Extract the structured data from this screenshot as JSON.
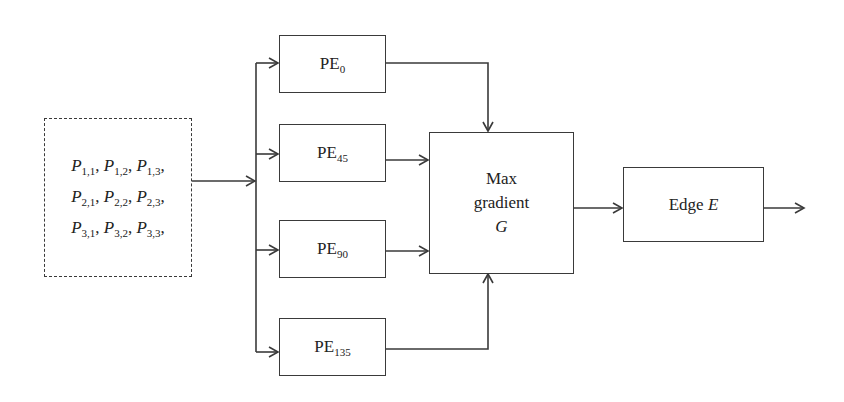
{
  "diagram": {
    "type": "block-diagram",
    "input": {
      "rows": [
        [
          {
            "var": "P",
            "sub": "1,1"
          },
          {
            "var": "P",
            "sub": "1,2"
          },
          {
            "var": "P",
            "sub": "1,3"
          }
        ],
        [
          {
            "var": "P",
            "sub": "2,1"
          },
          {
            "var": "P",
            "sub": "2,2"
          },
          {
            "var": "P",
            "sub": "2,3"
          }
        ],
        [
          {
            "var": "P",
            "sub": "3,1"
          },
          {
            "var": "P",
            "sub": "3,2"
          },
          {
            "var": "P",
            "sub": "3,3"
          }
        ]
      ],
      "text_rows": [
        "P1,1, P1,2, P1,3,",
        "P2,1, P2,2, P2,3,",
        "P3,1, P3,2, P3,3,"
      ],
      "border": "dashed"
    },
    "processing_elements": [
      {
        "base": "PE",
        "sub": "0"
      },
      {
        "base": "PE",
        "sub": "45"
      },
      {
        "base": "PE",
        "sub": "90"
      },
      {
        "base": "PE",
        "sub": "135"
      }
    ],
    "max_gradient": {
      "line1": "Max",
      "line2": "gradient",
      "line3": "G"
    },
    "edge": {
      "label": "Edge",
      "var": "E"
    },
    "colors": {
      "line": "#3a3a3a",
      "background": "#ffffff"
    }
  }
}
